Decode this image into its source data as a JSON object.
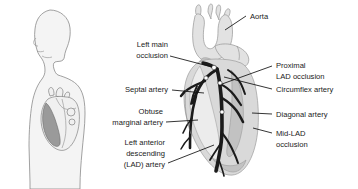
{
  "figure": {
    "background_color": "#ffffff",
    "text_color": "#1a1a1a",
    "artery_color": "#1b1b1b",
    "heart_fill_color": "#d9d9d9",
    "body_fill_color": "#f4f4f4"
  },
  "panels": {
    "left": {
      "name": "torso-silhouette",
      "description": "Side profile human torso with heart in chest"
    },
    "right": {
      "name": "heart-detail",
      "description": "Anterior view of heart with coronary arteries and occlusions"
    }
  },
  "labels": {
    "aorta": "Aorta",
    "left_main_occlusion_line1": "Left main",
    "left_main_occlusion_line2": "occlusion",
    "septal_artery": "Septal artery",
    "obtuse_marginal_line1": "Obtuse",
    "obtuse_marginal_line2": "marginal artery",
    "lad_line1": "Left anterior",
    "lad_line2": "descending",
    "lad_line3": "(LAD) artery",
    "proximal_lad_line1": "Proximal",
    "proximal_lad_line2": "LAD occlusion",
    "circumflex_artery": "Circumflex artery",
    "diagonal_artery": "Diagonal artery",
    "mid_lad_line1": "Mid-LAD",
    "mid_lad_line2": "occlusion"
  }
}
